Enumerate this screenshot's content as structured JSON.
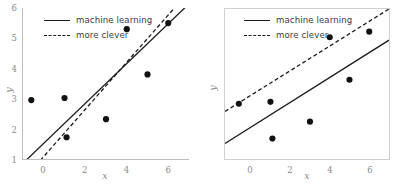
{
  "figure": {
    "background": "#ffffff",
    "line_color": "#1a1a1a",
    "point_color": "#111111",
    "axis_color": "#bdbdbd",
    "tick_text_color": "#8a8a8a"
  },
  "chart_data": [
    {
      "type": "scatter",
      "panel": "left",
      "title": "",
      "xlabel": "x",
      "ylabel": "y",
      "xlim": [
        -1.0,
        7.0
      ],
      "ylim": [
        1.0,
        6.0
      ],
      "xticks": [
        0,
        2,
        4,
        6
      ],
      "yticks": [
        1,
        2,
        3,
        4,
        5,
        6
      ],
      "xticklabels": [
        "0",
        "2",
        "4",
        "6"
      ],
      "yticklabels": [
        "1",
        "2",
        "3",
        "4",
        "5",
        "6"
      ],
      "grid": false,
      "frame": "left-bottom-spines",
      "legend_position": "upper-left",
      "points": [
        {
          "x": -0.6,
          "y": 2.95
        },
        {
          "x": 1.1,
          "y": 1.72
        },
        {
          "x": 1.0,
          "y": 3.02
        },
        {
          "x": 3.0,
          "y": 2.32
        },
        {
          "x": 4.0,
          "y": 5.3
        },
        {
          "x": 5.0,
          "y": 3.8
        },
        {
          "x": 6.0,
          "y": 5.5
        }
      ],
      "series": [
        {
          "name": "machine learning",
          "style": "solid",
          "type": "line",
          "x": [
            -1.0,
            7.0
          ],
          "y": [
            0.86,
            6.14
          ]
        },
        {
          "name": "more clever",
          "style": "dashed",
          "type": "line",
          "x": [
            -1.0,
            7.0
          ],
          "y": [
            0.3,
            6.55
          ]
        }
      ]
    },
    {
      "type": "scatter",
      "panel": "right",
      "title": "",
      "xlabel": "x",
      "ylabel": "y",
      "xlim": [
        -1.3,
        7.0
      ],
      "ylim": [
        1.0,
        6.3
      ],
      "xticks": [
        0,
        2,
        4,
        6
      ],
      "yticks": [],
      "xticklabels": [
        "0",
        "2",
        "4",
        "6"
      ],
      "yticklabels": [],
      "grid": false,
      "frame": "box",
      "legend_position": "upper-left",
      "points": [
        {
          "x": -0.6,
          "y": 2.95
        },
        {
          "x": 1.1,
          "y": 1.72
        },
        {
          "x": 1.0,
          "y": 3.02
        },
        {
          "x": 3.0,
          "y": 2.32
        },
        {
          "x": 4.0,
          "y": 5.3
        },
        {
          "x": 5.0,
          "y": 3.8
        },
        {
          "x": 6.0,
          "y": 5.5
        }
      ],
      "series": [
        {
          "name": "machine learning",
          "style": "solid",
          "type": "line",
          "x": [
            -1.3,
            7.0
          ],
          "y": [
            1.55,
            5.2
          ]
        },
        {
          "name": "more clever",
          "style": "dashed",
          "type": "line",
          "x": [
            -1.3,
            7.0
          ],
          "y": [
            2.68,
            6.3
          ]
        }
      ]
    }
  ],
  "legend": {
    "machine_learning": "machine learning",
    "more_clever": "more clever"
  },
  "labels": {
    "x": "x",
    "y": "y"
  }
}
